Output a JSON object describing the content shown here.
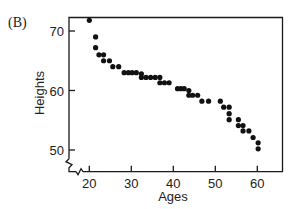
{
  "chart_data": {
    "type": "scatter",
    "panel_label": "(B)",
    "title": "",
    "xlabel": "Ages",
    "ylabel": "Heights",
    "xlim": [
      16.3,
      67
    ],
    "ylim": [
      46.3,
      72.4
    ],
    "xticks": [
      20,
      30,
      40,
      50,
      60
    ],
    "yticks": [
      50,
      60,
      70
    ],
    "x_tick_labels": [
      "20",
      "30",
      "40",
      "50",
      "60"
    ],
    "y_tick_labels": [
      "50",
      "60",
      "70"
    ],
    "axis_breaks": [
      "x",
      "y"
    ],
    "grid": false,
    "legend": null,
    "marker_color": "#111111",
    "points": [
      {
        "x": 20.0,
        "y": 71.8
      },
      {
        "x": 21.5,
        "y": 69.0
      },
      {
        "x": 21.5,
        "y": 67.2
      },
      {
        "x": 22.3,
        "y": 66.0
      },
      {
        "x": 23.4,
        "y": 66.0
      },
      {
        "x": 23.4,
        "y": 65.0
      },
      {
        "x": 24.8,
        "y": 65.0
      },
      {
        "x": 25.6,
        "y": 64.0
      },
      {
        "x": 27.0,
        "y": 64.0
      },
      {
        "x": 28.3,
        "y": 63.0
      },
      {
        "x": 29.3,
        "y": 63.0
      },
      {
        "x": 30.2,
        "y": 63.0
      },
      {
        "x": 31.2,
        "y": 63.0
      },
      {
        "x": 32.4,
        "y": 62.8
      },
      {
        "x": 32.4,
        "y": 62.2
      },
      {
        "x": 33.5,
        "y": 62.2
      },
      {
        "x": 34.6,
        "y": 62.2
      },
      {
        "x": 35.7,
        "y": 62.2
      },
      {
        "x": 36.8,
        "y": 62.2
      },
      {
        "x": 36.8,
        "y": 61.3
      },
      {
        "x": 37.9,
        "y": 61.3
      },
      {
        "x": 39.0,
        "y": 61.3
      },
      {
        "x": 41.0,
        "y": 60.3
      },
      {
        "x": 41.8,
        "y": 60.3
      },
      {
        "x": 42.6,
        "y": 60.3
      },
      {
        "x": 43.7,
        "y": 60.0
      },
      {
        "x": 43.7,
        "y": 59.2
      },
      {
        "x": 44.6,
        "y": 59.2
      },
      {
        "x": 45.8,
        "y": 59.2
      },
      {
        "x": 46.8,
        "y": 58.2
      },
      {
        "x": 48.4,
        "y": 58.2
      },
      {
        "x": 51.2,
        "y": 58.2
      },
      {
        "x": 52.0,
        "y": 57.2
      },
      {
        "x": 53.3,
        "y": 57.2
      },
      {
        "x": 53.3,
        "y": 56.1
      },
      {
        "x": 53.3,
        "y": 55.1
      },
      {
        "x": 55.5,
        "y": 55.1
      },
      {
        "x": 55.5,
        "y": 54.1
      },
      {
        "x": 56.6,
        "y": 54.1
      },
      {
        "x": 56.6,
        "y": 53.2
      },
      {
        "x": 58.0,
        "y": 53.2
      },
      {
        "x": 59.0,
        "y": 52.1
      },
      {
        "x": 60.2,
        "y": 51.2
      },
      {
        "x": 60.2,
        "y": 50.2
      }
    ]
  },
  "layout": {
    "plot": {
      "left": 69,
      "top": 17.5,
      "right": 282.5,
      "bottom": 171.7
    },
    "x_map": {
      "value0": 20,
      "px0": 89.3,
      "px_per_unit": 4.2
    },
    "y_map": {
      "value0": 70,
      "px0": 31,
      "px_per_unit": 5.95
    }
  }
}
